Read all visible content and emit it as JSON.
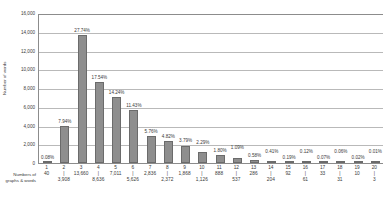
{
  "chart_data": {
    "type": "bar",
    "title": "",
    "xlabel": "Numbers of graphs & words",
    "ylabel": "Number of words",
    "ylim": [
      0,
      16000
    ],
    "grid": true,
    "legend": "none",
    "ytick_labels": [
      "16,000",
      "14,000",
      "12,000",
      "10,000",
      "8,000",
      "6,000",
      "4,000",
      "2,000",
      "0"
    ],
    "ytick_values": [
      16000,
      14000,
      12000,
      10000,
      8000,
      6000,
      4000,
      2000,
      0
    ],
    "categories": [
      "1",
      "2",
      "3",
      "4",
      "5",
      "6",
      "7",
      "8",
      "9",
      "10",
      "11",
      "12",
      "13",
      "14",
      "15",
      "16",
      "17",
      "18",
      "19",
      "20"
    ],
    "values": [
      40,
      3908,
      13660,
      8636,
      7011,
      5626,
      2836,
      2372,
      1868,
      1126,
      888,
      537,
      286,
      204,
      92,
      61,
      33,
      31,
      10,
      3
    ],
    "value_labels": [
      "40",
      "3,908",
      "13,660",
      "8,636",
      "7,011",
      "5,626",
      "2,836",
      "2,372",
      "1,868",
      "1,126",
      "888",
      "537",
      "286",
      "204",
      "92",
      "61",
      "33",
      "31",
      "10",
      "3"
    ],
    "percent_labels": [
      "0.08%",
      "7.94%",
      "27.74%",
      "17.54%",
      "14.24%",
      "11.43%",
      "5.76%",
      "4.82%",
      "3.79%",
      "2.29%",
      "1.80%",
      "1.09%",
      "0.58%",
      "0.41%",
      "0.19%",
      "0.12%",
      "0.07%",
      "0.06%",
      "0.02%",
      "0.01%"
    ],
    "percents": [
      0.08,
      7.94,
      27.74,
      17.54,
      14.24,
      11.43,
      5.76,
      4.82,
      3.79,
      2.29,
      1.8,
      1.09,
      0.58,
      0.41,
      0.19,
      0.12,
      0.07,
      0.06,
      0.02,
      0.01
    ],
    "bar_color": "#8e8e8e",
    "bar_border_color": "#6b6b6b",
    "grid_color": "#b9b9b9",
    "axis_color": "#8c8c8c",
    "text_color": "#3a3a3a",
    "tick_mark": "|"
  },
  "axis_titles": {
    "y": "Number of words",
    "x_line1": "Numbers of",
    "x_line2": "graphs & words"
  }
}
